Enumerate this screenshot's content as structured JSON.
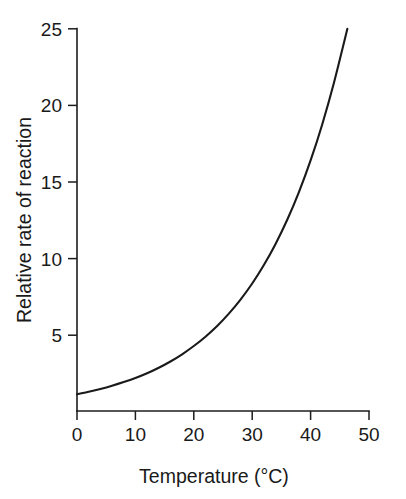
{
  "chart_data": {
    "type": "line",
    "title": "",
    "xlabel": "Temperature (°C)",
    "ylabel": "Relative rate of reaction",
    "xlim": [
      0,
      50
    ],
    "ylim": [
      0,
      25
    ],
    "xticks": [
      0,
      10,
      20,
      30,
      40,
      50
    ],
    "xtick_labels": [
      "0",
      "10",
      "20",
      "30",
      "40",
      "50"
    ],
    "yticks": [
      5,
      10,
      15,
      20,
      25
    ],
    "ytick_labels": [
      "5",
      "10",
      "15",
      "20",
      "25"
    ],
    "grid": false,
    "legend": null,
    "legend_position": "none",
    "annotations": [],
    "series": [
      {
        "name": "Relative rate of reaction",
        "description": "Exponential increase of relative reaction rate with temperature",
        "x": [
          0,
          2,
          4,
          6,
          8,
          10,
          12,
          14,
          16,
          18,
          20,
          22,
          24,
          26,
          28,
          30,
          32,
          34,
          36,
          38,
          40,
          42,
          44,
          46.3
        ],
        "y": [
          1.1,
          1.26,
          1.44,
          1.65,
          1.89,
          2.16,
          2.47,
          2.83,
          3.24,
          3.71,
          4.25,
          4.86,
          5.56,
          6.37,
          7.29,
          8.34,
          9.55,
          10.93,
          12.51,
          14.32,
          16.39,
          18.76,
          21.47,
          25.0
        ]
      }
    ]
  },
  "axis": {
    "y_title": "Relative rate of reaction",
    "x_title": "Temperature (°C)",
    "y_tick_0": "5",
    "y_tick_1": "10",
    "y_tick_2": "15",
    "y_tick_3": "20",
    "y_tick_4": "25",
    "x_tick_0": "0",
    "x_tick_1": "10",
    "x_tick_2": "20",
    "x_tick_3": "30",
    "x_tick_4": "40",
    "x_tick_5": "50"
  },
  "colors": {
    "background": "#ffffff",
    "axis": "#1c1c1c",
    "curve": "#1a1a1a",
    "text": "#1a1a1a"
  }
}
